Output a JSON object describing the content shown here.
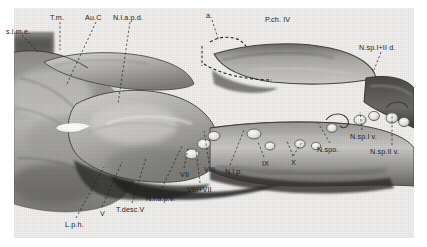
{
  "figure": {
    "medium": "halftone photographic plate",
    "ink": "#1b1b1b",
    "paper": "#f3f2f0",
    "plate_border": "#ffffff"
  },
  "labels": [
    {
      "id": "s-i-m-e",
      "text": "s.i.m.e.",
      "x": 6,
      "y": 28
    },
    {
      "id": "t-m",
      "text": "T.m.",
      "x": 50,
      "y": 14
    },
    {
      "id": "au-c",
      "text": "Au.C",
      "x": 85,
      "y": 14
    },
    {
      "id": "n-l-a-p-d",
      "text": "N.l.a.p.d.",
      "x": 113,
      "y": 14
    },
    {
      "id": "a",
      "text": "a.",
      "x": 206,
      "y": 12
    },
    {
      "id": "p-ch-iv",
      "text": "P.ch. IV",
      "x": 265,
      "y": 16
    },
    {
      "id": "n-sp-i-ii-d",
      "text": "N.sp.I+II d.",
      "x": 359,
      "y": 44
    },
    {
      "id": "n-sp-i-v",
      "text": "N.sp.I v.",
      "x": 350,
      "y": 133
    },
    {
      "id": "n-spo",
      "text": "N.spo.",
      "x": 317,
      "y": 146
    },
    {
      "id": "n-sp-ii-v",
      "text": "N.sp.II v.",
      "x": 370,
      "y": 148
    },
    {
      "id": "x",
      "text": "X",
      "x": 291,
      "y": 159
    },
    {
      "id": "ix",
      "text": "IX",
      "x": 262,
      "y": 160
    },
    {
      "id": "n-l-p",
      "text": "N.l.p.",
      "x": 225,
      "y": 168
    },
    {
      "id": "viii",
      "text": "VIII",
      "x": 204,
      "y": 166
    },
    {
      "id": "vii",
      "text": "VII",
      "x": 180,
      "y": 171
    },
    {
      "id": "viii-plus-vii",
      "text": "VIII+VII",
      "x": 187,
      "y": 186
    },
    {
      "id": "n-l-a-p-v",
      "text": "N.l.a.p.v.",
      "x": 146,
      "y": 195
    },
    {
      "id": "t-desc-v",
      "text": "T.desc.V",
      "x": 116,
      "y": 206
    },
    {
      "id": "v",
      "text": "V",
      "x": 100,
      "y": 210
    },
    {
      "id": "l-p-h",
      "text": "L.p.h.",
      "x": 65,
      "y": 221
    }
  ],
  "leaders": [
    {
      "id": "leader-s-i-m-e",
      "points": "22,35 38,52"
    },
    {
      "id": "leader-t-m",
      "points": "60,22 60,50"
    },
    {
      "id": "leader-au-c",
      "points": "96,22 66,86"
    },
    {
      "id": "leader-n-l-a-p-d",
      "points": "130,22 118,104"
    },
    {
      "id": "leader-a",
      "points": "212,20 219,41"
    },
    {
      "id": "leader-n-sp-i-ii-d",
      "points": "381,52 374,70"
    },
    {
      "id": "leader-n-sp-i-v",
      "points": "362,130 360,112"
    },
    {
      "id": "leader-n-spo",
      "points": "330,143 318,123"
    },
    {
      "id": "leader-n-sp-ii-v",
      "points": "392,145 392,114"
    },
    {
      "id": "leader-x-a",
      "points": "293,156 287,141"
    },
    {
      "id": "leader-x-b",
      "points": "293,156 302,142"
    },
    {
      "id": "leader-ix",
      "points": "264,157 258,142"
    },
    {
      "id": "leader-n-l-p",
      "points": "230,165 244,130"
    },
    {
      "id": "leader-viii",
      "points": "209,163 204,131"
    },
    {
      "id": "leader-vii",
      "points": "184,168 188,148"
    },
    {
      "id": "leader-viii-vii",
      "points": "200,183 196,150"
    },
    {
      "id": "leader-n-l-a-p-v",
      "points": "160,192 182,146"
    },
    {
      "id": "leader-t-desc-v",
      "points": "132,203 146,158"
    },
    {
      "id": "leader-v",
      "points": "102,207 122,162"
    },
    {
      "id": "leader-l-p-h",
      "points": "76,218 104,167"
    }
  ]
}
